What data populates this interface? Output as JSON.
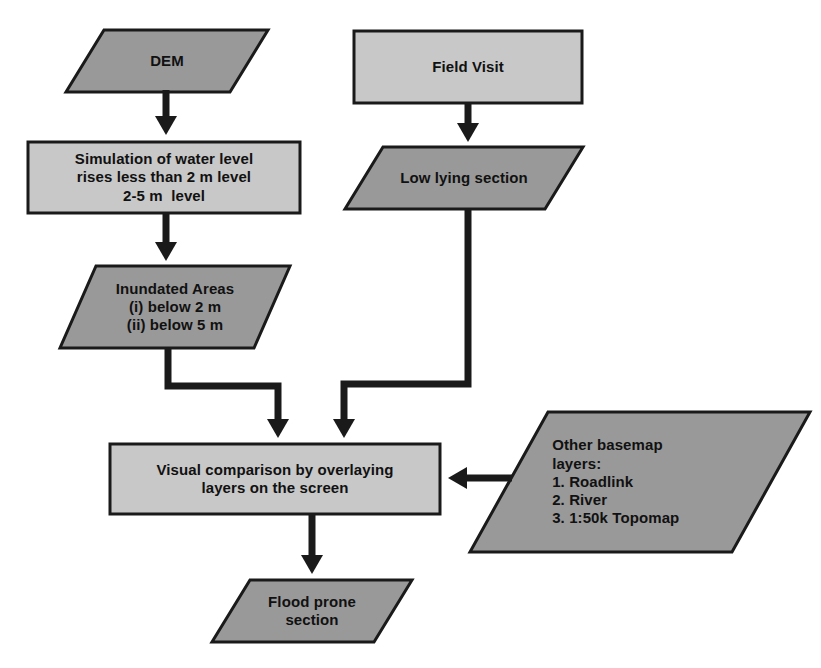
{
  "diagram": {
    "background": "#ffffff",
    "palette": {
      "dark_gray_fill": "#999999",
      "light_gray_fill": "#c8c8c8",
      "stroke": "#1a1a1a",
      "text": "#111111"
    }
  },
  "nodes": [
    {
      "id": "dem",
      "name": "dem",
      "shape": "parallelogram",
      "fill": "#999999",
      "lines": [
        "DEM"
      ],
      "font_size": 15,
      "align": "center",
      "box": {
        "x": 66,
        "y": 30,
        "w": 202,
        "h": 62
      },
      "skew": 38
    },
    {
      "id": "field-visit",
      "name": "field-visit",
      "shape": "rectangle",
      "fill": "#c8c8c8",
      "lines": [
        "Field Visit"
      ],
      "font_size": 15,
      "align": "center",
      "box": {
        "x": 354,
        "y": 31,
        "w": 228,
        "h": 72
      },
      "skew": 0
    },
    {
      "id": "simulation",
      "name": "simulation-of-water-level",
      "shape": "rectangle",
      "fill": "#c8c8c8",
      "lines": [
        "Simulation of water level",
        "rises less than 2 m level",
        "2-5 m  level"
      ],
      "font_size": 15,
      "align": "center",
      "box": {
        "x": 28,
        "y": 142,
        "w": 272,
        "h": 71
      },
      "skew": 0
    },
    {
      "id": "low-lying",
      "name": "low-lying-section",
      "shape": "parallelogram",
      "fill": "#999999",
      "lines": [
        "Low lying section"
      ],
      "font_size": 15,
      "align": "center",
      "box": {
        "x": 345,
        "y": 147,
        "w": 238,
        "h": 62
      },
      "skew": 38
    },
    {
      "id": "inundated",
      "name": "inundated-areas",
      "shape": "parallelogram",
      "fill": "#999999",
      "lines": [
        "Inundated Areas",
        "(i) below 2 m",
        "(ii) below 5 m"
      ],
      "font_size": 15,
      "align": "center",
      "box": {
        "x": 60,
        "y": 266,
        "w": 230,
        "h": 82
      },
      "skew": 36
    },
    {
      "id": "visual-comparison",
      "name": "visual-comparison-by-overlaying-layers",
      "shape": "rectangle",
      "fill": "#c8c8c8",
      "lines": [
        "Visual comparison by overlaying",
        "layers on the screen"
      ],
      "font_size": 15,
      "align": "center",
      "box": {
        "x": 110,
        "y": 444,
        "w": 330,
        "h": 70
      },
      "skew": 0
    },
    {
      "id": "other-basemap",
      "name": "other-basemap-layers",
      "shape": "parallelogram",
      "fill": "#999999",
      "lines": [
        "Other basemap",
        "layers:",
        "1. Roadlink",
        "2. River",
        "3. 1:50k Topomap"
      ],
      "font_size": 15,
      "align": "left",
      "box": {
        "x": 470,
        "y": 412,
        "w": 340,
        "h": 140
      },
      "skew": 78
    },
    {
      "id": "flood-prone",
      "name": "flood-prone-section",
      "shape": "parallelogram",
      "fill": "#999999",
      "lines": [
        "Flood prone",
        "section"
      ],
      "font_size": 15,
      "align": "center",
      "box": {
        "x": 212,
        "y": 580,
        "w": 200,
        "h": 62
      },
      "skew": 38
    }
  ],
  "connectors": [
    {
      "id": "dem-to-simulation",
      "name": "connector-dem-to-simulation",
      "from": "dem",
      "to": "simulation",
      "points": "166,90 166,135",
      "arrow": "down"
    },
    {
      "id": "fieldvisit-to-lowlying",
      "name": "connector-field-visit-to-low-lying-section",
      "from": "field-visit",
      "to": "low-lying",
      "points": "468,103 468,142",
      "arrow": "down"
    },
    {
      "id": "simulation-to-inundated",
      "name": "connector-simulation-to-inundated-areas",
      "from": "simulation",
      "to": "inundated",
      "points": "166,213 166,261",
      "arrow": "down"
    },
    {
      "id": "inundated-to-visual",
      "name": "connector-inundated-areas-to-visual-comparison",
      "from": "inundated",
      "to": "visual-comparison",
      "points": "168,348 168,386 278,386 278,438",
      "arrow": "down"
    },
    {
      "id": "lowlying-to-visual",
      "name": "connector-low-lying-section-to-visual-comparison",
      "from": "low-lying",
      "to": "visual-comparison",
      "points": "468,209 468,384 344,384 344,438",
      "arrow": "down"
    },
    {
      "id": "basemap-to-visual",
      "name": "connector-other-basemap-layers-to-visual-comparison",
      "from": "other-basemap",
      "to": "visual-comparison",
      "points": "512,478 448,478",
      "arrow": "left"
    },
    {
      "id": "visual-to-flood",
      "name": "connector-visual-comparison-to-flood-prone-section",
      "from": "visual-comparison",
      "to": "flood-prone",
      "points": "312,514 312,574",
      "arrow": "down"
    }
  ]
}
